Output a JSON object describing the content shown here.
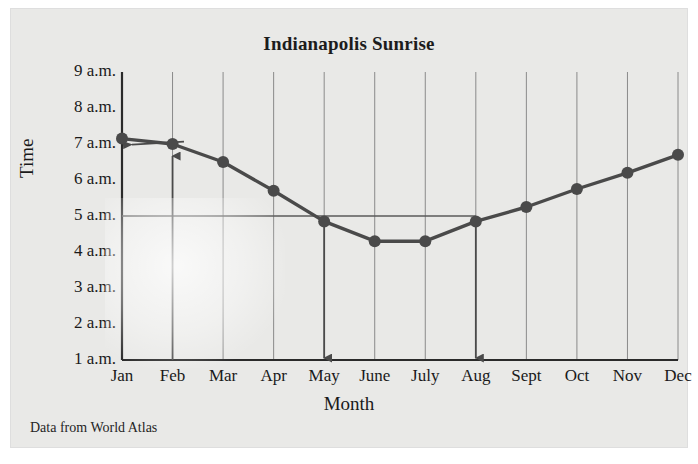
{
  "figure": {
    "title": "Indianapolis Sunrise",
    "source_note": "Data from World Atlas"
  },
  "chart_data": {
    "type": "line",
    "title": "Indianapolis Sunrise",
    "xlabel": "Month",
    "ylabel": "Time",
    "categories": [
      "Jan",
      "Feb",
      "Mar",
      "Apr",
      "May",
      "June",
      "July",
      "Aug",
      "Sept",
      "Oct",
      "Nov",
      "Dec"
    ],
    "values": [
      7.15,
      7.0,
      6.5,
      5.7,
      4.85,
      4.3,
      4.3,
      4.85,
      5.25,
      5.75,
      6.2,
      6.7
    ],
    "y_tick_labels": [
      "1 a.m.",
      "2 a.m.",
      "3 a.m.",
      "4 a.m.",
      "5 a.m.",
      "6 a.m.",
      "7 a.m.",
      "8 a.m.",
      "9 a.m."
    ],
    "y_tick_values": [
      1,
      2,
      3,
      4,
      5,
      6,
      7,
      8,
      9
    ],
    "ylim": [
      1,
      9
    ],
    "grid": "vertical",
    "legend": "none",
    "series_color": "#4a4a4a",
    "marker": "circle",
    "annotations": [
      {
        "name": "reference-line-5am",
        "type": "horizontal-line",
        "y": 5,
        "x_from": "Jan",
        "x_to": "Aug"
      },
      {
        "name": "arrow-to-jan-point",
        "type": "arrow",
        "direction": "left",
        "target": "Jan"
      },
      {
        "name": "arrow-to-feb-point",
        "type": "arrow",
        "direction": "up",
        "target": "Feb"
      },
      {
        "name": "arrow-down-may",
        "type": "arrow",
        "direction": "down",
        "target": "May"
      },
      {
        "name": "arrow-down-aug",
        "type": "arrow",
        "direction": "down",
        "target": "Aug"
      }
    ]
  },
  "colors": {
    "panel_background": "#e9e9e7",
    "line": "#4a4a4a",
    "axis": "#2a2a2a",
    "gridline": "#8a8a8a",
    "text": "#1a1a1a"
  }
}
